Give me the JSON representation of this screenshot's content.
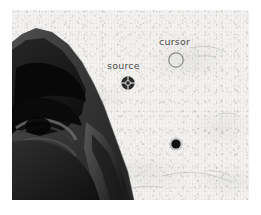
{
  "scene": {
    "width": 261,
    "height": 215,
    "page_background": "#ffffff",
    "plate_background": "#f4f3f1"
  },
  "photo": {
    "description": "grayscale close-up photograph of a face showing brow, eye and nose against a mottled light speckled background",
    "subject_name": "face-silhouette",
    "subject_fill": "#1a1a1a"
  },
  "annotations": [
    {
      "id": "source",
      "label": "source",
      "label_x": 95,
      "label_y": 51,
      "marker_type": "crosshair-circle",
      "marker_x": 116,
      "marker_y": 73,
      "marker_radius": 6,
      "marker_color": "#2b2b2b",
      "filled": true
    },
    {
      "id": "cursor",
      "label": "cursor",
      "label_x": 147,
      "label_y": 27,
      "marker_type": "hollow-circle",
      "marker_x": 164,
      "marker_y": 50,
      "marker_radius": 7,
      "marker_color": "#8d8d8d",
      "filled": false
    },
    {
      "id": "plain-dot",
      "label": "",
      "marker_type": "filled-dot",
      "marker_x": 164,
      "marker_y": 134,
      "marker_radius": 4.5,
      "marker_color": "#121212",
      "filled": true
    }
  ],
  "labels": {
    "source": "source",
    "cursor": "cursor"
  }
}
